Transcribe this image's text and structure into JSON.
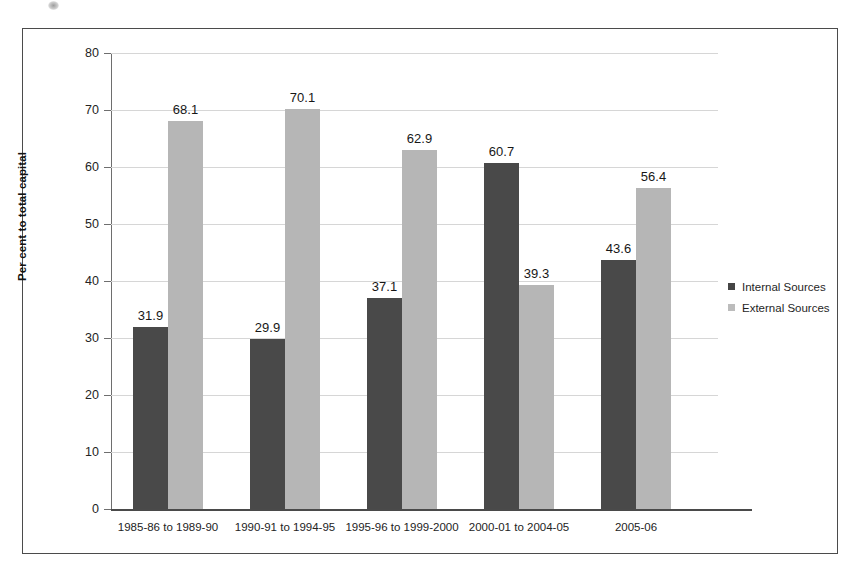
{
  "chart_data": {
    "type": "bar",
    "title": "",
    "xlabel": "",
    "ylabel": "Per cent to total capital",
    "ylim": [
      0,
      80
    ],
    "yticks": [
      0,
      10,
      20,
      30,
      40,
      50,
      60,
      70,
      80
    ],
    "ytick_labels": [
      "0",
      "10",
      "20",
      "30",
      "40",
      "50",
      "60",
      "70",
      "80"
    ],
    "grid": true,
    "legend_position": "right",
    "categories": [
      "1985-86 to 1989-90",
      "1990-91 to 1994-95",
      "1995-96 to 1999-2000",
      "2000-01 to 2004-05",
      "2005-06"
    ],
    "series": [
      {
        "name": "Internal Sources",
        "color": "#494949",
        "values": [
          31.9,
          29.9,
          37.1,
          60.7,
          43.6
        ],
        "labels": [
          "31.9",
          "29.9",
          "37.1",
          "60.7",
          "43.6"
        ]
      },
      {
        "name": "External Sources",
        "color": "#b6b6b6",
        "values": [
          68.1,
          70.1,
          62.9,
          39.3,
          56.4
        ],
        "labels": [
          "68.1",
          "70.1",
          "62.9",
          "39.3",
          "56.4"
        ]
      }
    ]
  },
  "legend": {
    "items": [
      {
        "label": "Internal Sources",
        "color": "#494949"
      },
      {
        "label": "External Sources",
        "color": "#b6b6b6"
      }
    ]
  },
  "colors": {
    "internal": "#494949",
    "external": "#b6b6b6",
    "grid": "#d6d6d6",
    "axis": "#4a4a4a",
    "frame": "#4b4b4b",
    "text": "#1d1d1d"
  }
}
